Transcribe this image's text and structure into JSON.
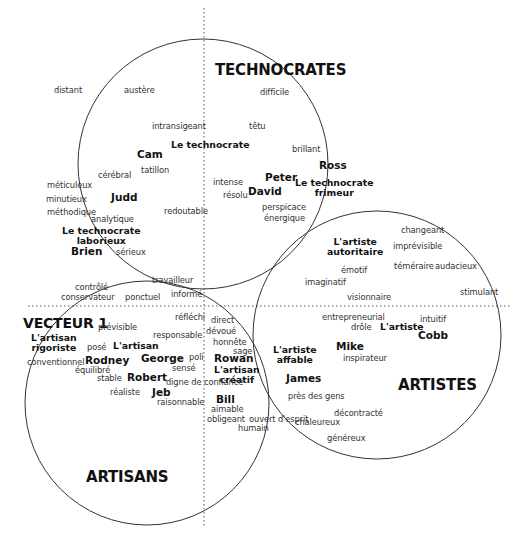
{
  "diagram": {
    "axis_label": "VECTEUR 1",
    "circles": [
      {
        "id": "technocrates",
        "label": "TECHNOCRATES",
        "cx": 203,
        "cy": 164,
        "r": 125
      },
      {
        "id": "artistes",
        "label": "ARTISTES",
        "cx": 377,
        "cy": 335,
        "r": 124
      },
      {
        "id": "artisans",
        "label": "ARTISANS",
        "cx": 147,
        "cy": 403,
        "r": 122
      }
    ],
    "axes": {
      "vertical_x": 204,
      "horizontal_y": 306,
      "style": "dotted"
    },
    "groups": {
      "technocrates": "TECHNOCRATES",
      "artistes": "ARTISTES",
      "artisans": "ARTISANS"
    },
    "profiles": {
      "technocrate": "Le technocrate",
      "technocrate_laborieux_1": "Le technocrate",
      "technocrate_laborieux_2": "laborieux",
      "technocrate_frimeur_1": "Le technocrate",
      "technocrate_frimeur_2": "frimeur",
      "artiste_autoritaire_1": "L'artiste",
      "artiste_autoritaire_2": "autoritaire",
      "artiste": "L'artiste",
      "artiste_affable_1": "L'artiste",
      "artiste_affable_2": "affable",
      "artisan_rigoriste_1": "L'artisan",
      "artisan_rigoriste_2": "rigoriste",
      "artisan": "L'artisan",
      "artisan_creatif_1": "L'artisan",
      "artisan_creatif_2": "créatif"
    },
    "names": {
      "cam": "Cam",
      "judd": "Judd",
      "brien": "Brien",
      "peter": "Peter",
      "david": "David",
      "ross": "Ross",
      "cobb": "Cobb",
      "mike": "Mike",
      "james": "James",
      "rodney": "Rodney",
      "george": "George",
      "robert": "Robert",
      "jeb": "Jeb",
      "rowan": "Rowan",
      "bill": "Bill"
    },
    "words": {
      "distant": "distant",
      "austere": "austère",
      "difficile": "difficile",
      "intransigeant": "intransigeant",
      "tetu": "têtu",
      "brillant": "brillant",
      "tatillon": "tatillon",
      "cerebral": "cérébral",
      "meticuleux": "méticuleux",
      "minutieux": "minutieux",
      "methodique": "méthodique",
      "analytique": "analytique",
      "redoutable": "redoutable",
      "intense": "intense",
      "resolu": "résolu",
      "perspicace": "perspicace",
      "energique": "énergique",
      "serieux": "sérieux",
      "travailleur": "travailleur",
      "controle": "contrôlé",
      "conservateur": "conservateur",
      "ponctuel": "ponctuel",
      "informe": "informé",
      "changeant": "changeant",
      "imprevisible": "imprévisible",
      "emotif": "émotif",
      "temeraire": "téméraire",
      "audacieux": "audacieux",
      "imaginatif": "imaginatif",
      "stimulant": "stimulant",
      "visionnaire": "visionnaire",
      "entrepreneurial": "entrepreneurial",
      "intuitif": "intuitif",
      "drole": "drôle",
      "inspirateur": "inspirateur",
      "pres_des_gens": "près des gens",
      "decontracte": "décontracté",
      "chaleureux": "chaleureux",
      "genereux": "généreux",
      "reflechi": "réfléchi",
      "direct": "direct",
      "devoue": "dévoué",
      "honnete": "honnête",
      "sage": "sage",
      "previsible": "prévisible",
      "responsable": "responsable",
      "pose": "posé",
      "poli": "poli",
      "conventionnel": "conventionnel",
      "sense": "sensé",
      "equilibre": "équilibré",
      "stable": "stable",
      "digne_de_confiance": "digne de confiance",
      "realiste": "réaliste",
      "raisonnable": "raisonnable",
      "aimable": "aimable",
      "obligeant": "obligeant",
      "ouvert_d_esprit": "ouvert d'esprit",
      "humain": "humain"
    }
  }
}
